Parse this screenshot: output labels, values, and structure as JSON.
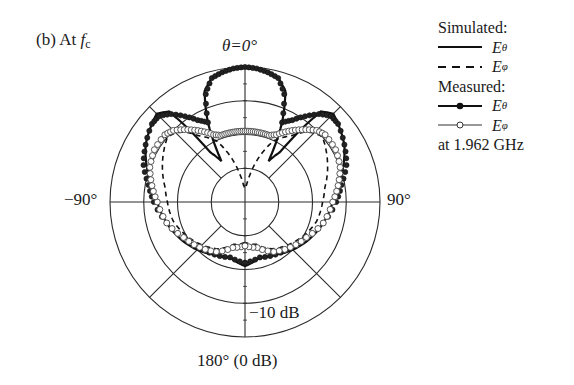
{
  "figure": {
    "panel_label": "(b) At ",
    "panel_label_var": "f",
    "panel_label_sub": "c",
    "top_label": "θ=0°",
    "left_label": "−90°",
    "right_label": "90°",
    "bottom_label": "180° (0 dB)",
    "scale_label": "−10 dB"
  },
  "legend": {
    "simulated_header": "Simulated:",
    "measured_header": "Measured:",
    "entries": [
      {
        "group": "Simulated",
        "symbol": "E",
        "sub": "θ",
        "style": "solid"
      },
      {
        "group": "Simulated",
        "symbol": "E",
        "sub": "φ",
        "style": "dashed"
      },
      {
        "group": "Measured",
        "symbol": "E",
        "sub": "θ",
        "style": "solid-filled-circle"
      },
      {
        "group": "Measured",
        "symbol": "E",
        "sub": "φ",
        "style": "solid-open-circle"
      }
    ],
    "frequency_note": "at 1.962 GHz"
  },
  "chart_data": {
    "type": "polar",
    "title": "(b) At fc",
    "angle_labels": [
      "θ=0°",
      "90°",
      "180° (0 dB)",
      "−90°"
    ],
    "radial_unit": "dB",
    "radial_range": [
      -40,
      0
    ],
    "radial_ticks": [
      0,
      -10,
      -20,
      -30
    ],
    "radial_tick_label": "−10 dB",
    "grid": {
      "rings": 4,
      "spokes_deg": [
        0,
        45,
        90,
        135,
        180,
        225,
        270,
        315
      ]
    },
    "frequency": "1.962 GHz",
    "angles_deg": [
      -180,
      -165,
      -150,
      -135,
      -120,
      -105,
      -90,
      -80,
      -70,
      -60,
      -50,
      -45,
      -40,
      -35,
      -30,
      -25,
      -20,
      -15,
      -10,
      -5,
      0,
      5,
      10,
      15,
      20,
      25,
      30,
      35,
      40,
      45,
      50,
      60,
      70,
      80,
      90,
      105,
      120,
      135,
      150,
      165,
      180
    ],
    "series": [
      {
        "name": "Simulated Eθ",
        "style": "solid",
        "values_db": [
          -21,
          -23,
          -22,
          -20,
          -18,
          -16,
          -14,
          -12,
          -9,
          -6,
          -4,
          -3,
          -5,
          -22,
          -26,
          -14,
          -5,
          -2,
          -0.8,
          -0.2,
          0,
          -0.2,
          -0.8,
          -2,
          -5,
          -14,
          -26,
          -22,
          -5,
          -3,
          -4,
          -6,
          -9,
          -12,
          -14,
          -16,
          -18,
          -20,
          -22,
          -23,
          -21
        ]
      },
      {
        "name": "Simulated Eφ",
        "style": "dashed",
        "values_db": [
          -28,
          -27,
          -24,
          -22,
          -20,
          -18,
          -17,
          -16,
          -14,
          -12,
          -10,
          -11,
          -13,
          -16,
          -18,
          -20,
          -24,
          -28,
          -32,
          -35,
          -36,
          -35,
          -32,
          -28,
          -24,
          -20,
          -18,
          -16,
          -13,
          -11,
          -10,
          -12,
          -14,
          -16,
          -17,
          -18,
          -20,
          -22,
          -24,
          -27,
          -28
        ]
      },
      {
        "name": "Measured Eθ",
        "style": "filled-circle",
        "values_db": [
          -22,
          -23,
          -22,
          -21,
          -19,
          -16,
          -13,
          -11,
          -8,
          -6,
          -4,
          -4,
          -6,
          -9,
          -12,
          -14,
          -6,
          -2,
          -1,
          -0.3,
          0,
          -0.3,
          -1,
          -2,
          -6,
          -14,
          -12,
          -9,
          -6,
          -4,
          -4,
          -6,
          -8,
          -11,
          -13,
          -16,
          -19,
          -21,
          -22,
          -23,
          -22
        ]
      },
      {
        "name": "Measured Eφ",
        "style": "open-circle",
        "values_db": [
          -27,
          -26,
          -23,
          -21,
          -19,
          -16,
          -14,
          -12,
          -10,
          -9,
          -9,
          -10,
          -12,
          -14,
          -16,
          -18,
          -19,
          -19,
          -19,
          -19,
          -19,
          -19,
          -19,
          -19,
          -19,
          -18,
          -16,
          -14,
          -12,
          -10,
          -9,
          -9,
          -10,
          -12,
          -14,
          -16,
          -19,
          -21,
          -23,
          -26,
          -27
        ]
      }
    ],
    "legend_position": "right"
  }
}
